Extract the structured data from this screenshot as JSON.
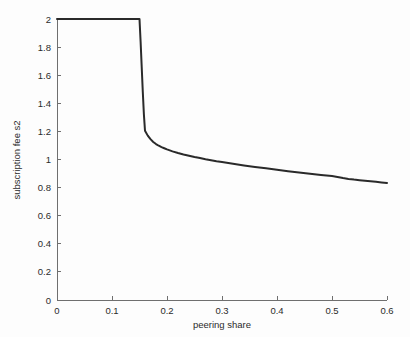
{
  "chart_data": {
    "type": "line",
    "title": "",
    "xlabel": "peering share",
    "ylabel": "subscription fee s2",
    "xlim": [
      0,
      0.6
    ],
    "ylim": [
      0,
      2
    ],
    "grid": false,
    "legend": null,
    "xticks": [
      "0",
      "0.1",
      "0.2",
      "0.3",
      "0.4",
      "0.5",
      "0.6"
    ],
    "xtick_values": [
      0,
      0.1,
      0.2,
      0.3,
      0.4,
      0.5,
      0.6
    ],
    "yticks": [
      "0",
      "0.2",
      "0.4",
      "0.6",
      "0.8",
      "1",
      "1.2",
      "1.4",
      "1.6",
      "1.8",
      "2"
    ],
    "ytick_values": [
      0,
      0.2,
      0.4,
      0.6,
      0.8,
      1,
      1.2,
      1.4,
      1.6,
      1.8,
      2
    ],
    "series": [
      {
        "name": "subscription fee s2",
        "color": "#2a2a2a",
        "x": [
          0.0,
          0.01,
          0.02,
          0.03,
          0.04,
          0.05,
          0.06,
          0.07,
          0.08,
          0.09,
          0.1,
          0.11,
          0.12,
          0.13,
          0.14,
          0.145,
          0.15,
          0.152,
          0.154,
          0.156,
          0.158,
          0.16,
          0.165,
          0.17,
          0.175,
          0.18,
          0.185,
          0.19,
          0.195,
          0.2,
          0.21,
          0.22,
          0.23,
          0.24,
          0.25,
          0.26,
          0.27,
          0.28,
          0.29,
          0.3,
          0.32,
          0.34,
          0.36,
          0.38,
          0.4,
          0.42,
          0.44,
          0.46,
          0.48,
          0.5,
          0.51,
          0.52,
          0.53,
          0.54,
          0.55,
          0.56,
          0.57,
          0.58,
          0.59,
          0.6
        ],
        "y": [
          2.0,
          2.0,
          2.0,
          2.0,
          2.0,
          2.0,
          2.0,
          2.0,
          2.0,
          2.0,
          2.0,
          2.0,
          2.0,
          2.0,
          2.0,
          2.0,
          2.0,
          1.84,
          1.66,
          1.48,
          1.32,
          1.205,
          1.17,
          1.145,
          1.125,
          1.11,
          1.098,
          1.088,
          1.08,
          1.072,
          1.058,
          1.046,
          1.036,
          1.027,
          1.018,
          1.01,
          1.002,
          0.995,
          0.988,
          0.982,
          0.97,
          0.958,
          0.947,
          0.937,
          0.927,
          0.917,
          0.907,
          0.898,
          0.89,
          0.882,
          0.876,
          0.868,
          0.862,
          0.857,
          0.853,
          0.849,
          0.845,
          0.841,
          0.837,
          0.833
        ]
      }
    ],
    "annotations": []
  },
  "figure": {
    "background_color": "#fdfdfd",
    "axis_color": "#6f6f6f",
    "line_color": "#2a2a2a"
  }
}
